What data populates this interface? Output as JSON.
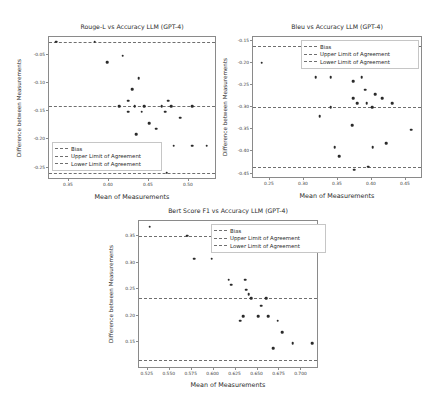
{
  "figure": {
    "background": "#ffffff",
    "marker_color": "#2a2a2a",
    "line_color": "#6f6f6f",
    "axis_color": "#8a8a8a"
  },
  "chart_data": [
    {
      "type": "scatter",
      "title": "Rouge-L vs Accuracy LLM (GPT-4)",
      "xlabel": "Mean of Measurements",
      "ylabel": "Difference between Measurements",
      "xlim": [
        0.325,
        0.535
      ],
      "ylim": [
        -0.272,
        -0.018
      ],
      "xticks": [
        0.35,
        0.4,
        0.45,
        0.5
      ],
      "xticklabels": [
        "0.35",
        "0.40",
        "0.45",
        "0.50"
      ],
      "yticks": [
        -0.05,
        -0.1,
        -0.15,
        -0.2,
        -0.25
      ],
      "yticklabels": [
        "-0.05",
        "-0.10",
        "-0.15",
        "-0.20",
        "-0.25"
      ],
      "grid": false,
      "legend_position": "lower left",
      "legend": [
        "Bias",
        "Upper Limit of Agreement",
        "Lower Limit of Agreement"
      ],
      "bias": -0.141,
      "upper_limit": -0.026,
      "lower_limit": -0.259,
      "points": [
        {
          "x": 0.334,
          "y": -0.026
        },
        {
          "x": 0.382,
          "y": -0.026
        },
        {
          "x": 0.398,
          "y": -0.063
        },
        {
          "x": 0.417,
          "y": -0.051
        },
        {
          "x": 0.437,
          "y": -0.091
        },
        {
          "x": 0.429,
          "y": -0.111
        },
        {
          "x": 0.424,
          "y": -0.131
        },
        {
          "x": 0.413,
          "y": -0.141
        },
        {
          "x": 0.432,
          "y": -0.141
        },
        {
          "x": 0.444,
          "y": -0.141
        },
        {
          "x": 0.466,
          "y": -0.141
        },
        {
          "x": 0.478,
          "y": -0.141
        },
        {
          "x": 0.504,
          "y": -0.141
        },
        {
          "x": 0.424,
          "y": -0.151
        },
        {
          "x": 0.441,
          "y": -0.151
        },
        {
          "x": 0.47,
          "y": -0.151
        },
        {
          "x": 0.474,
          "y": -0.131
        },
        {
          "x": 0.489,
          "y": -0.161
        },
        {
          "x": 0.459,
          "y": -0.181
        },
        {
          "x": 0.434,
          "y": -0.191
        },
        {
          "x": 0.45,
          "y": -0.171
        },
        {
          "x": 0.481,
          "y": -0.211
        },
        {
          "x": 0.504,
          "y": -0.211
        },
        {
          "x": 0.522,
          "y": -0.211
        },
        {
          "x": 0.472,
          "y": -0.259
        }
      ]
    },
    {
      "type": "scatter",
      "title": "Bleu vs Accuracy LLM (GPT-4)",
      "xlabel": "Mean of Measurements",
      "ylabel": "Difference between Measurements",
      "xlim": [
        0.225,
        0.475
      ],
      "ylim": [
        -0.462,
        -0.142
      ],
      "xticks": [
        0.25,
        0.3,
        0.35,
        0.4,
        0.45
      ],
      "xticklabels": [
        "0.25",
        "0.30",
        "0.35",
        "0.40",
        "0.45"
      ],
      "yticks": [
        -0.15,
        -0.2,
        -0.25,
        -0.3,
        -0.35,
        -0.4,
        -0.45
      ],
      "yticklabels": [
        "-0.15",
        "-0.20",
        "-0.25",
        "-0.30",
        "-0.35",
        "-0.40",
        "-0.45"
      ],
      "grid": false,
      "legend_position": "upper right",
      "legend": [
        "Bias",
        "Upper Limit of Agreement",
        "Lower Limit of Agreement"
      ],
      "bias": -0.3,
      "upper_limit": -0.162,
      "lower_limit": -0.434,
      "points": [
        {
          "x": 0.31,
          "y": -0.162
        },
        {
          "x": 0.238,
          "y": -0.2
        },
        {
          "x": 0.317,
          "y": -0.233
        },
        {
          "x": 0.339,
          "y": -0.233
        },
        {
          "x": 0.372,
          "y": -0.241
        },
        {
          "x": 0.385,
          "y": -0.233
        },
        {
          "x": 0.39,
          "y": -0.261
        },
        {
          "x": 0.372,
          "y": -0.28
        },
        {
          "x": 0.405,
          "y": -0.271
        },
        {
          "x": 0.415,
          "y": -0.28
        },
        {
          "x": 0.378,
          "y": -0.291
        },
        {
          "x": 0.392,
          "y": -0.291
        },
        {
          "x": 0.43,
          "y": -0.291
        },
        {
          "x": 0.339,
          "y": -0.3
        },
        {
          "x": 0.4,
          "y": -0.3
        },
        {
          "x": 0.323,
          "y": -0.321
        },
        {
          "x": 0.371,
          "y": -0.341
        },
        {
          "x": 0.458,
          "y": -0.351
        },
        {
          "x": 0.345,
          "y": -0.391
        },
        {
          "x": 0.401,
          "y": -0.391
        },
        {
          "x": 0.421,
          "y": -0.381
        },
        {
          "x": 0.352,
          "y": -0.411
        },
        {
          "x": 0.374,
          "y": -0.441
        },
        {
          "x": 0.394,
          "y": -0.434
        }
      ]
    },
    {
      "type": "scatter",
      "title": "Bert Score F1 vs Accuracy LLM (GPT-4)",
      "xlabel": "Mean of Measurements",
      "ylabel": "Difference between Measurements",
      "xlim": [
        0.515,
        0.72
      ],
      "ylim": [
        0.1,
        0.378
      ],
      "xticks": [
        0.525,
        0.55,
        0.575,
        0.6,
        0.625,
        0.65,
        0.675,
        0.7
      ],
      "xticklabels": [
        "0.525",
        "0.550",
        "0.575",
        "0.600",
        "0.625",
        "0.650",
        "0.675",
        "0.700"
      ],
      "yticks": [
        0.35,
        0.3,
        0.25,
        0.2,
        0.15
      ],
      "yticklabels": [
        "0.35",
        "0.30",
        "0.25",
        "0.20",
        "0.15"
      ],
      "grid": false,
      "legend_position": "upper right",
      "legend": [
        "Bias",
        "Upper Limit of Agreement",
        "Lower Limit of Agreement"
      ],
      "bias": 0.2335,
      "upper_limit": 0.3505,
      "lower_limit": 0.1175,
      "points": [
        {
          "x": 0.527,
          "y": 0.367
        },
        {
          "x": 0.57,
          "y": 0.3505
        },
        {
          "x": 0.578,
          "y": 0.307
        },
        {
          "x": 0.598,
          "y": 0.307
        },
        {
          "x": 0.617,
          "y": 0.268
        },
        {
          "x": 0.636,
          "y": 0.268
        },
        {
          "x": 0.62,
          "y": 0.258
        },
        {
          "x": 0.637,
          "y": 0.249
        },
        {
          "x": 0.64,
          "y": 0.241
        },
        {
          "x": 0.643,
          "y": 0.2335
        },
        {
          "x": 0.66,
          "y": 0.2335
        },
        {
          "x": 0.654,
          "y": 0.219
        },
        {
          "x": 0.634,
          "y": 0.199
        },
        {
          "x": 0.651,
          "y": 0.199
        },
        {
          "x": 0.662,
          "y": 0.199
        },
        {
          "x": 0.63,
          "y": 0.191
        },
        {
          "x": 0.673,
          "y": 0.191
        },
        {
          "x": 0.678,
          "y": 0.169
        },
        {
          "x": 0.668,
          "y": 0.139
        },
        {
          "x": 0.69,
          "y": 0.149
        },
        {
          "x": 0.712,
          "y": 0.149
        }
      ]
    }
  ]
}
